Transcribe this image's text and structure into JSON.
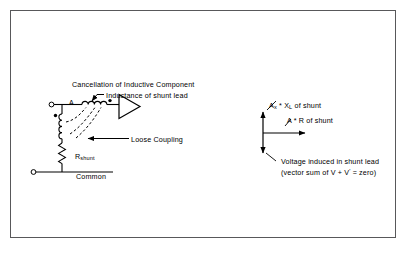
{
  "figure": {
    "border_color": "#58585a",
    "background": "#ffffff",
    "line_color": "#000000"
  },
  "circuit": {
    "title": "Cancellation of Inductive Component",
    "node_label": "A",
    "inductance_callout": "Inductance of shunt lead",
    "loose_coupling_callout": "Loose Coupling",
    "resistor_label_main": "R",
    "resistor_label_sub": "shunt",
    "common_label": "Common",
    "symbols": {
      "series_inductor": "coil-inductor",
      "shunt_inductor": "coil-inductor",
      "resistor": "zigzag-resistor",
      "amplifier": "triangle-amplifier",
      "terminal_top": "open-circle-terminal",
      "terminal_bottom": "open-circle-terminal",
      "polarity_dots": "coupling-dot",
      "coupling_lines": "dashed-coupling"
    }
  },
  "vector_diagram": {
    "label_reactive_main": "A",
    "label_reactive_sub": "x",
    "label_reactive_mid": " * X",
    "label_reactive_sub2": "L",
    "label_reactive_tail": " of shunt",
    "label_resistive": "A * R of shunt",
    "caption_line1": "Voltage induced in shunt lead",
    "caption_line2_a": "(vector sum of V + V",
    "caption_line2_prime": "'",
    "caption_line2_b": " = zero)",
    "vectors": [
      {
        "name": "reactive-up",
        "direction": "up"
      },
      {
        "name": "resistive-right",
        "direction": "right"
      },
      {
        "name": "induced-down",
        "direction": "down"
      }
    ]
  }
}
